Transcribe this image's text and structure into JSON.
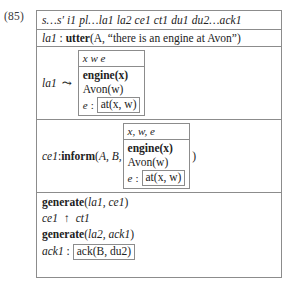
{
  "figure": {
    "equation_number": "(85)",
    "universe_row": "s…s′ i1 pl…la1 la2 ce1 ct1 du1 du2…ack1",
    "utter_line": {
      "label": "la1",
      "colon": " : ",
      "predicate": "utter",
      "open": "(",
      "args": "A, “there is an engine at Avon”",
      "close": ")"
    },
    "la1_drs": {
      "label": "la1",
      "relation_symbol": "⤳",
      "universe": "x w e",
      "conditions": [
        "engine(x)",
        "Avon(w)"
      ],
      "event_var": "e",
      "event_colon": ":",
      "event_condition": "at(x, w)"
    },
    "inform_line": {
      "label": "ce1",
      "colon": " : ",
      "predicate": "inform",
      "open": "(",
      "args": "A, B,",
      "close": ")"
    },
    "ce1_drs": {
      "universe": "x, w, e",
      "conditions": [
        "engine(x)",
        "Avon(w)"
      ],
      "event_var": "e",
      "event_colon": ":",
      "event_condition": "at(x, w)"
    },
    "bottom_lines": {
      "generate_1": {
        "predicate": "generate",
        "open": "(",
        "args": "la1, ce1",
        "close": ")"
      },
      "dominance": {
        "left": "ce1",
        "symbol": "↑",
        "right": "ct1"
      },
      "generate_2": {
        "predicate": "generate",
        "open": "(",
        "args": "la2, ack1",
        "close": ")"
      },
      "ack_line": {
        "label": "ack1",
        "colon": " : ",
        "boxed_content": "ack(B, du2)"
      }
    }
  },
  "colors": {
    "border": "#8c8c8c",
    "text": "#1a1a1a",
    "background": "#ffffff"
  }
}
